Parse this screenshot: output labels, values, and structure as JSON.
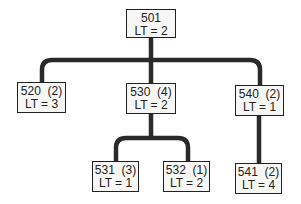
{
  "nodes": {
    "n501": {
      "id_label": "501",
      "lt": "LT = 2"
    },
    "n520": {
      "id_label": "520  (2)",
      "lt": "LT = 3"
    },
    "n530": {
      "id_label": "530  (4)",
      "lt": "LT = 2"
    },
    "n540": {
      "id_label": "540  (2)",
      "lt": "LT = 1"
    },
    "n531": {
      "id_label": "531  (3)",
      "lt": "LT = 1"
    },
    "n532": {
      "id_label": "532  (1)",
      "lt": "LT = 2"
    },
    "n541": {
      "id_label": "541  (2)",
      "lt": "LT = 4"
    }
  },
  "edges": [
    [
      "501",
      "520"
    ],
    [
      "501",
      "530"
    ],
    [
      "501",
      "540"
    ],
    [
      "530",
      "531"
    ],
    [
      "530",
      "532"
    ],
    [
      "540",
      "541"
    ]
  ],
  "colors": {
    "line": "#2a2a2a",
    "box_fill": "#f7f7f5",
    "border": "#222222"
  }
}
